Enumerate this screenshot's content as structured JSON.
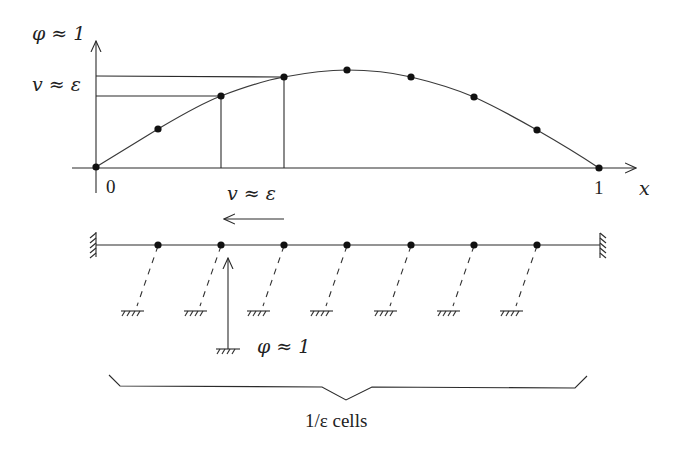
{
  "figure": {
    "top_graph": {
      "y_axis_label": "φ ≈ 1",
      "y_tick_label": "v ≈ ε",
      "x_axis_label": "x",
      "x_origin_label": "0",
      "x_end_label": "1",
      "x_interval_label": "v ≈ ε",
      "curve_points": [
        [
          96,
          167
        ],
        [
          158,
          129
        ],
        [
          221,
          96
        ],
        [
          284,
          77
        ],
        [
          347,
          70
        ],
        [
          411,
          77
        ],
        [
          474,
          97
        ],
        [
          537,
          130
        ],
        [
          599,
          168
        ]
      ]
    },
    "chain": {
      "mass_count": 7,
      "mass_x": [
        158,
        221,
        284,
        347,
        411,
        474,
        537
      ],
      "line_y": 245,
      "left_wall": "fixed-wall",
      "right_wall": "fixed-wall",
      "velocity_arrow_label": "v ≈ ε",
      "velocity_direction": "left",
      "force_label": "φ ≈ 1",
      "brace_label": "1/ε cells"
    },
    "colors": {
      "ink": "#222222",
      "background": "#ffffff"
    }
  }
}
